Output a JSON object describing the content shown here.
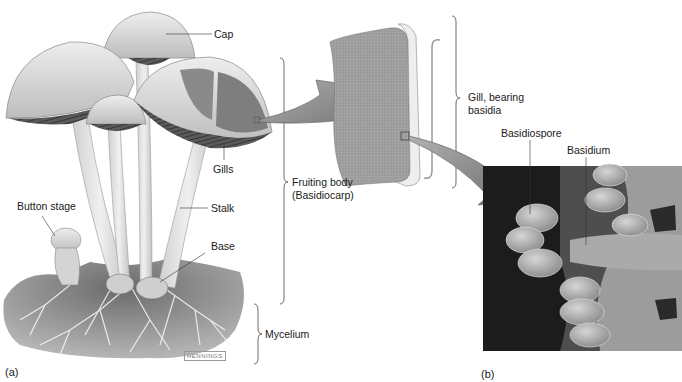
{
  "figure": {
    "panel_a_label": "(a)",
    "panel_b_label": "(b)",
    "artist_signature": "HENNINGS"
  },
  "labels": {
    "cap": "Cap",
    "gills": "Gills",
    "button_stage": "Button stage",
    "stalk": "Stalk",
    "base": "Base",
    "fruiting_body_line1": "Fruiting body",
    "fruiting_body_line2": "(Basidiocarp)",
    "mycelium": "Mycelium",
    "gill_bearing_line1": "Gill, bearing",
    "gill_bearing_line2": "basidia",
    "basidiospore": "Basidiospore",
    "basidium": "Basidium"
  },
  "colors": {
    "cap_fill": "#d9d9d9",
    "gill_dark": "#4a4a4a",
    "stalk_fill": "#e2e2e2",
    "soil": "#8a8a8a",
    "arrow_fill": "#8c8c8c",
    "gill_block": "#9a9a9a",
    "sem_background": "#1c1c1c",
    "sem_spores": "#b8b8b8"
  }
}
